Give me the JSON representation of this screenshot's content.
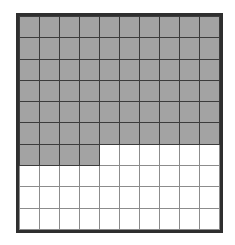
{
  "figure": {
    "name": "hundredths-grid",
    "rows": 10,
    "columns": 10,
    "total_cells": 100,
    "shaded_cells": 64,
    "unshaded_cells": 36,
    "fraction_shaded": "64/100",
    "decimal_shaded": "0.64",
    "percent_shaded": "64%"
  },
  "colors": {
    "shaded_fill": "#a3a3a3",
    "unshaded_fill": "#ffffff",
    "outer_border": "#2f2f2f",
    "gridline_dark": "#3c3c3c",
    "gridline_light": "#8c8c8c",
    "page_background": "#ffffff"
  },
  "chart_data": {
    "type": "heatmap",
    "title": "",
    "xlabel": "",
    "ylabel": "",
    "rows": 10,
    "columns": 10,
    "legend": [
      {
        "key": 1,
        "label": "shaded",
        "color": "#a3a3a3"
      },
      {
        "key": 0,
        "label": "unshaded",
        "color": "#ffffff"
      }
    ],
    "row_shaded_counts": [
      10,
      10,
      10,
      10,
      10,
      10,
      4,
      0,
      0,
      0
    ],
    "cells": [
      [
        1,
        1,
        1,
        1,
        1,
        1,
        1,
        1,
        1,
        1
      ],
      [
        1,
        1,
        1,
        1,
        1,
        1,
        1,
        1,
        1,
        1
      ],
      [
        1,
        1,
        1,
        1,
        1,
        1,
        1,
        1,
        1,
        1
      ],
      [
        1,
        1,
        1,
        1,
        1,
        1,
        1,
        1,
        1,
        1
      ],
      [
        1,
        1,
        1,
        1,
        1,
        1,
        1,
        1,
        1,
        1
      ],
      [
        1,
        1,
        1,
        1,
        1,
        1,
        1,
        1,
        1,
        1
      ],
      [
        1,
        1,
        1,
        1,
        0,
        0,
        0,
        0,
        0,
        0
      ],
      [
        0,
        0,
        0,
        0,
        0,
        0,
        0,
        0,
        0,
        0
      ],
      [
        0,
        0,
        0,
        0,
        0,
        0,
        0,
        0,
        0,
        0
      ],
      [
        0,
        0,
        0,
        0,
        0,
        0,
        0,
        0,
        0,
        0
      ]
    ]
  }
}
